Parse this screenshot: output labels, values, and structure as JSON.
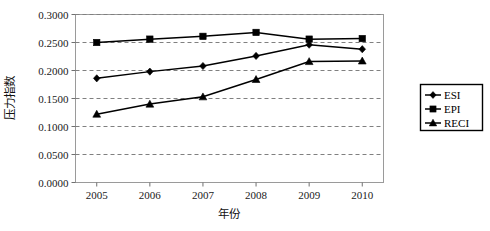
{
  "chart_data": {
    "type": "line",
    "title": "",
    "xlabel": "年份",
    "ylabel": "压力指数",
    "categories": [
      "2005",
      "2006",
      "2007",
      "2008",
      "2009",
      "2010"
    ],
    "x": [
      2005,
      2006,
      2007,
      2008,
      2009,
      2010
    ],
    "xlim": [
      2004.6,
      2010.4
    ],
    "ylim": [
      0.0,
      0.3
    ],
    "yticks": [
      "0.0000",
      "0.0500",
      "0.1000",
      "0.1500",
      "0.2000",
      "0.2500",
      "0.3000"
    ],
    "ytick_values": [
      0.0,
      0.05,
      0.1,
      0.15,
      0.2,
      0.25,
      0.3
    ],
    "grid": true,
    "grid_style": "dashed-horizontal",
    "legend_position": "right-outside",
    "series": [
      {
        "name": "ESI",
        "marker": "diamond",
        "color": "#000000",
        "values": [
          0.186,
          0.198,
          0.208,
          0.226,
          0.246,
          0.238
        ]
      },
      {
        "name": "EPI",
        "marker": "square",
        "color": "#000000",
        "values": [
          0.25,
          0.256,
          0.261,
          0.268,
          0.256,
          0.257
        ]
      },
      {
        "name": "RECI",
        "marker": "triangle",
        "color": "#000000",
        "values": [
          0.122,
          0.14,
          0.153,
          0.184,
          0.216,
          0.217
        ]
      }
    ]
  },
  "legend": {
    "entries": [
      {
        "label": "ESI",
        "marker": "diamond"
      },
      {
        "label": "EPI",
        "marker": "square"
      },
      {
        "label": "RECI",
        "marker": "triangle"
      }
    ]
  },
  "axes": {
    "y_title": "压力指数",
    "x_title": "年份"
  }
}
